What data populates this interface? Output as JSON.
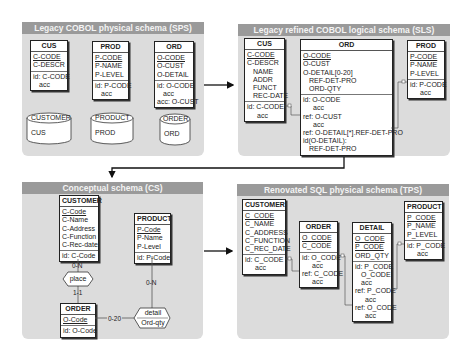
{
  "panels": {
    "sps": {
      "title": "Legacy COBOL physical schema (SPS)",
      "entities": {
        "cus": {
          "name": "CUS",
          "fields": [
            "C-CODE",
            "C-DESCR"
          ],
          "constraints": [
            "id: C-CODE",
            "acc"
          ]
        },
        "prod": {
          "name": "PROD",
          "fields": [
            "P-CODE",
            "P-NAME",
            "P-LEVEL"
          ],
          "constraints": [
            "id: P-CODE",
            "acc"
          ]
        },
        "ord": {
          "name": "ORD",
          "fields": [
            "O-CODE",
            "O-CUST",
            "O-DETAIL"
          ],
          "constraints": [
            "id: O-CODE",
            "acc",
            "acc: O-CUST"
          ]
        }
      },
      "files": [
        {
          "name": "CUSTOMER",
          "record": "CUS"
        },
        {
          "name": "PRODUCT",
          "record": "PROD"
        },
        {
          "name": "ORDER",
          "record": "ORD"
        }
      ]
    },
    "sls": {
      "title": "Legacy refined COBOL logical schema (SLS)",
      "entities": {
        "cus": {
          "name": "CUS",
          "fields": [
            "C-CODE",
            "C-DESCR",
            "NAME",
            "ADDR",
            "FUNCT",
            "REC-DATE"
          ],
          "constraints": [
            "id: C-CODE",
            "acc"
          ]
        },
        "ord": {
          "name": "ORD",
          "fields": [
            "O-CODE",
            "O-CUST",
            "O-DETAIL[0-20]",
            "REF-DET-PRO",
            "ORD-QTY"
          ],
          "constraints": [
            "id: O-CODE",
            "acc",
            "ref: O-CUST",
            "acc",
            "ref: O-DETAIL[*].REF-DET-PRO",
            "id(O-DETAIL):",
            "REF-DET-PRO"
          ]
        },
        "prod": {
          "name": "PROD",
          "fields": [
            "P-CODE",
            "P-NAME",
            "P-LEVEL"
          ],
          "constraints": [
            "id: P-CODE",
            "acc"
          ]
        }
      }
    },
    "cs": {
      "title": "Conceptual schema (CS)",
      "entities": {
        "customer": {
          "name": "CUSTOMER",
          "fields": [
            "C-Code",
            "C-Name",
            "C-Address",
            "C-Function",
            "C-Rec-date"
          ],
          "constraints": [
            "id: C-Code"
          ]
        },
        "product": {
          "name": "PRODUCT",
          "fields": [
            "P-Code",
            "P-Name",
            "P-Level"
          ],
          "constraints": [
            "id: P-Code"
          ]
        },
        "order": {
          "name": "ORDER",
          "fields": [
            "O-Code"
          ],
          "constraints": [
            "id: O-Code"
          ]
        }
      },
      "relationships": {
        "place": {
          "name": "place",
          "card_customer": "0-N",
          "card_order": "1-1"
        },
        "detail": {
          "name": "detail",
          "attribute": "Ord-qty",
          "card_product": "0-N",
          "card_order": "0-20"
        }
      }
    },
    "tps": {
      "title": "Renovated SQL physical schema (TPS)",
      "entities": {
        "customer": {
          "name": "CUSTOMER",
          "fields": [
            "C_CODE",
            "C_NAME",
            "C_ADDRESS",
            "C_FUNCTION",
            "C_REC_DATE"
          ],
          "constraints": [
            "id: C_CODE",
            "acc"
          ]
        },
        "order": {
          "name": "ORDER",
          "fields": [
            "O_CODE",
            "C_CODE"
          ],
          "constraints": [
            "id: O_CODE",
            "acc",
            "ref: C_CODE",
            "acc"
          ]
        },
        "detail": {
          "name": "DETAIL",
          "fields": [
            "O_CODE",
            "P_CODE",
            "ORD_QTY"
          ],
          "constraints": [
            "id: P_CODE",
            "O_CODE",
            "acc",
            "ref: P_CODE",
            "acc",
            "ref: O_CODE",
            "acc"
          ]
        },
        "product": {
          "name": "PRODUCT",
          "fields": [
            "P_CODE",
            "P_NAME",
            "P_LEVEL"
          ],
          "constraints": [
            "id: P_CODE",
            "acc"
          ]
        }
      }
    }
  },
  "colors": {
    "panel_bg": "#dcdcdc",
    "title_bar": "#9a9a9a",
    "title_text": "#f4f4f4",
    "arrow": "#111111"
  }
}
